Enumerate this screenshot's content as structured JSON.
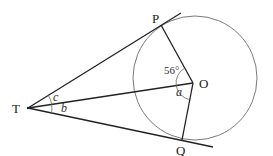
{
  "diagram": {
    "type": "geometry",
    "points": {
      "T": {
        "label": "T",
        "x": 28,
        "y": 108
      },
      "P": {
        "label": "P",
        "x": 161,
        "y": 25
      },
      "O": {
        "label": "O",
        "x": 193,
        "y": 83
      },
      "Q": {
        "label": "Q",
        "x": 182,
        "y": 140
      }
    },
    "circle": {
      "center": "O",
      "cx": 195,
      "cy": 78,
      "r": 62,
      "color": "#777777"
    },
    "line_color": "#222222",
    "angles": {
      "POT": {
        "label": "56°",
        "vertex": "O"
      },
      "TOQ": {
        "label": "a",
        "vertex": "O"
      },
      "PTO": {
        "label": "c",
        "vertex": "T"
      },
      "OTQ": {
        "label": "b",
        "vertex": "T"
      }
    },
    "segments": [
      "TP (tangent)",
      "TQ (tangent)",
      "TO",
      "OP",
      "OQ"
    ]
  }
}
